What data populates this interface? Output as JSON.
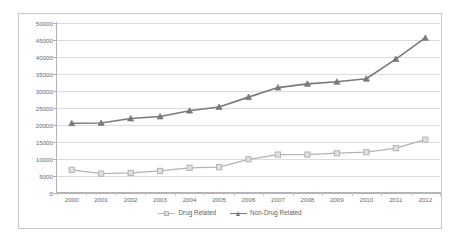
{
  "chart_data": {
    "type": "line",
    "title": "",
    "subtitle": "",
    "xlabel": "",
    "ylabel": "",
    "categories": [
      "2000",
      "2001",
      "2002",
      "2003",
      "2004",
      "2005",
      "2006",
      "2007",
      "2008",
      "2009",
      "2010",
      "2011",
      "2012"
    ],
    "x": [
      2000,
      2001,
      2002,
      2003,
      2004,
      2005,
      2006,
      2007,
      2008,
      2009,
      2010,
      2011,
      2012
    ],
    "series": [
      {
        "name": "Drug Related",
        "color": "#b3b3b3",
        "marker": "square",
        "values": [
          6800,
          5700,
          5900,
          6500,
          7400,
          7600,
          9900,
          11300,
          11300,
          11700,
          12000,
          13200,
          15700
        ]
      },
      {
        "name": "Non-Drug Related",
        "color": "#7a7a7a",
        "marker": "triangle",
        "values": [
          20500,
          20600,
          21900,
          22500,
          24200,
          25300,
          28200,
          31000,
          32100,
          32700,
          33600,
          39400,
          45600
        ]
      }
    ],
    "ylim": [
      0,
      50000
    ],
    "yticks": [
      0,
      5000,
      10000,
      15000,
      20000,
      25000,
      30000,
      35000,
      40000,
      45000,
      50000
    ],
    "ytick_labels": [
      "0",
      "5000",
      "10000",
      "15000",
      "20000",
      "25000",
      "30000",
      "35000",
      "40000",
      "45000",
      "50000"
    ],
    "grid": true,
    "grid_axis": "y",
    "legend_position": "bottom",
    "legend_entries": [
      "Drug Related",
      "Non-Drug Related"
    ],
    "plot_background": "#ffffff",
    "gridline_color": "#dcdcdc",
    "axis_color": "#b4b4b4",
    "border_color": "#c8c8c8",
    "tick_label_color": "#6b6b6b"
  }
}
